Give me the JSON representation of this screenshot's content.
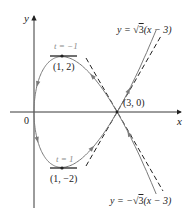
{
  "figure": {
    "axes": {
      "x_label": "x",
      "y_label": "y",
      "origin_label": "0"
    },
    "curve": {
      "param_x": "t^2",
      "param_y": "t^3 - 3t",
      "t_range": [
        -2.1,
        2.1
      ],
      "color": "#7a7a7a"
    },
    "points": [
      {
        "label": "(1, 2)",
        "x": 1,
        "y": 2,
        "param_label": "t = −1"
      },
      {
        "label": "(1, −2)",
        "x": 1,
        "y": -2,
        "param_label": "t = 1"
      },
      {
        "label": "(3, 0)",
        "x": 3,
        "y": 0
      }
    ],
    "tangent_lines": [
      {
        "label_prefix": "y = ",
        "sqrt_part": "3",
        "label_suffix": "(x − 3)",
        "slope_sign": 1
      },
      {
        "label_prefix": "y = −",
        "sqrt_part": "3",
        "label_suffix": "(x − 3)",
        "slope_sign": -1
      }
    ]
  }
}
